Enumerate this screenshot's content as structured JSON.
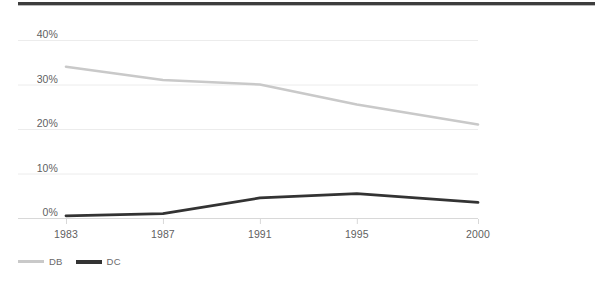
{
  "decor": {
    "top_rule_name": "top-horizontal-rule"
  },
  "chart_data": {
    "type": "line",
    "title": "",
    "subtitle": "",
    "xlabel": "",
    "ylabel": "",
    "categories": [
      "1983",
      "1987",
      "1991",
      "1995",
      "2000"
    ],
    "x": [
      1983,
      1987,
      1991,
      1995,
      2000
    ],
    "series": [
      {
        "name": "DB",
        "color": "#c9c9c9",
        "values": [
          34,
          31,
          30,
          25.5,
          21
        ]
      },
      {
        "name": "DC",
        "color": "#333333",
        "values": [
          0.5,
          1,
          4.5,
          5.5,
          3.5
        ]
      }
    ],
    "ylim": [
      0,
      40
    ],
    "xlim": [
      1983,
      2000
    ],
    "y_ticks": [
      0,
      10,
      20,
      30,
      40
    ],
    "y_tick_labels": [
      "0%",
      "10%",
      "20%",
      "30%",
      "40%"
    ],
    "x_tick_labels": [
      "1983",
      "1987",
      "1991",
      "1995",
      "2000"
    ],
    "grid": true,
    "grid_axis": "y",
    "grid_color": "#ececec",
    "axis_color": "#d8d8d8",
    "legend_position": "bottom-left",
    "legend_entries": [
      "DB",
      "DC"
    ]
  }
}
